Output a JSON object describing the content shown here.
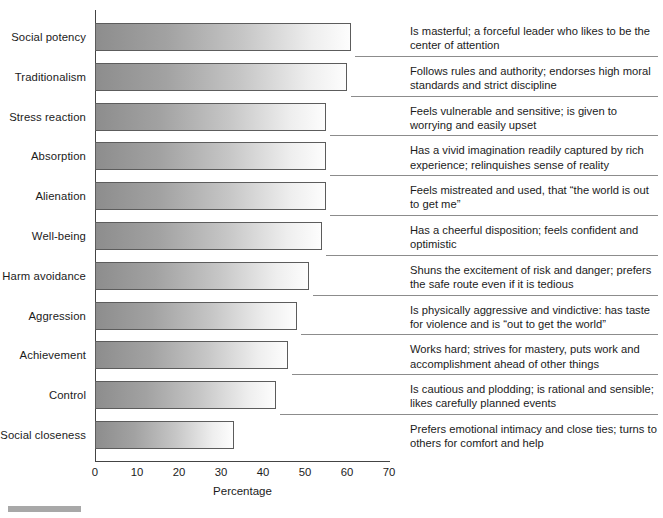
{
  "chart_data": {
    "type": "bar",
    "title": "",
    "xlabel": "Percentage",
    "ylabel": "",
    "xlim": [
      0,
      70
    ],
    "ylim": null,
    "grid": false,
    "legend": "none",
    "orientation": "horizontal",
    "ticks": [
      "0",
      "10",
      "20",
      "30",
      "40",
      "50",
      "60",
      "70"
    ],
    "categories": [
      "Social potency",
      "Traditionalism",
      "Stress reaction",
      "Absorption",
      "Alienation",
      "Well-being",
      "Harm avoidance",
      "Aggression",
      "Achievement",
      "Control",
      "Social closeness"
    ],
    "values": [
      61,
      60,
      55,
      55,
      55,
      54,
      51,
      48,
      46,
      43,
      33
    ],
    "annotations": [
      "Is masterful; a forceful leader who likes to be the center of attention",
      "Follows rules and authority; endorses high moral standards and strict discipline",
      "Feels vulnerable and sensitive; is given to worrying and easily upset",
      "Has a vivid imagination readily captured by rich experience; relinquishes sense of reality",
      "Feels mistreated and used, that “the world is out to get me”",
      "Has a cheerful disposition; feels confident and optimistic",
      "Shuns the excitement of risk and danger; prefers the safe route even if it is tedious",
      "Is physically aggressive and vindictive: has taste for violence and is “out to get the world”",
      "Works hard; strives for mastery, puts work and accomplishment ahead of other things",
      "Is cautious and plodding; is rational and sensible; likes carefully planned events",
      "Prefers emotional intimacy and close ties; turns to others for comfort and help"
    ]
  },
  "colors": {
    "bar_gradient_start": "#8d8d8d",
    "bar_gradient_end": "#fdfdfd",
    "bar_border": "#5c5c5c",
    "axis": "#444444",
    "separator": "#8c8c8c",
    "text": "#1b1b1b",
    "background": "#ffffff",
    "footer_mark": "#a8a8a8"
  }
}
